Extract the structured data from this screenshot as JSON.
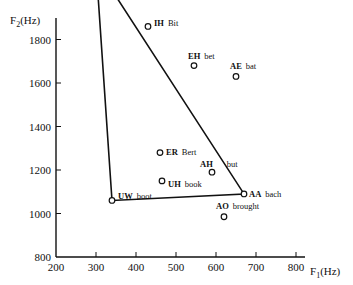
{
  "chart_data": {
    "type": "scatter",
    "title": "",
    "xlabel": "F1(Hz)",
    "ylabel": "F2(Hz)",
    "xlim": [
      200,
      900
    ],
    "ylim": [
      800,
      2500
    ],
    "x_ticks": [
      200,
      300,
      400,
      500,
      600,
      700,
      800
    ],
    "y_ticks": [
      800,
      1000,
      1200,
      1400,
      1600,
      1800,
      2000,
      2200,
      2400
    ],
    "grid": false,
    "legend": "none",
    "points": [
      {
        "code": "IY",
        "word": "beet",
        "f1": 300,
        "f2": 2140
      },
      {
        "code": "IH",
        "word": "Bit",
        "f1": 430,
        "f2": 1860
      },
      {
        "code": "EH",
        "word": "bet",
        "f1": 545,
        "f2": 1680
      },
      {
        "code": "AE",
        "word": "bat",
        "f1": 650,
        "f2": 1630
      },
      {
        "code": "ER",
        "word": "Bert",
        "f1": 460,
        "f2": 1280
      },
      {
        "code": "AH",
        "word": "but",
        "f1": 590,
        "f2": 1190
      },
      {
        "code": "UH",
        "word": "book",
        "f1": 465,
        "f2": 1150
      },
      {
        "code": "UW",
        "word": "boot",
        "f1": 340,
        "f2": 1060
      },
      {
        "code": "AA",
        "word": "bach",
        "f1": 670,
        "f2": 1090
      },
      {
        "code": "AO",
        "word": "brought",
        "f1": 620,
        "f2": 985
      }
    ],
    "vowel_triangle": [
      "IY",
      "UW",
      "AA"
    ]
  },
  "axes": {
    "x_title": "F",
    "x_title_sub": "1",
    "x_title_unit": "(Hz)",
    "y_title": "F",
    "y_title_sub": "2",
    "y_title_unit": "(Hz)"
  }
}
